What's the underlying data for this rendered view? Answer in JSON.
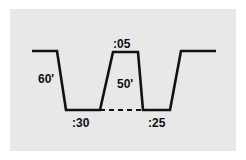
{
  "figure": {
    "background_color": "#ffffff",
    "panel_color": "#e8e8e8",
    "line_color": "#111111",
    "text_color": "#111111"
  },
  "labels": {
    "left_segment_elevation": "60'",
    "center_peak_time": ":05",
    "center_peak_elevation": "50'",
    "left_trough_time": ":30",
    "right_trough_time": ":25"
  },
  "chart_data": {
    "type": "line",
    "title": "",
    "xlabel": "",
    "ylabel": "",
    "grid": false,
    "legend": null,
    "xlim": [
      0,
      246
    ],
    "ylim": [
      160,
      0
    ],
    "series": [
      {
        "name": "profile",
        "style": "solid",
        "points": [
          [
            32,
            51
          ],
          [
            57,
            51
          ],
          [
            66,
            110
          ],
          [
            100,
            110
          ],
          [
            113,
            52
          ],
          [
            138,
            52
          ],
          [
            143,
            110
          ],
          [
            170,
            110
          ],
          [
            181,
            51
          ],
          [
            216,
            51
          ]
        ]
      },
      {
        "name": "trough-reference",
        "style": "dashed",
        "points": [
          [
            100,
            110
          ],
          [
            143,
            110
          ]
        ]
      }
    ],
    "annotations": [
      {
        "text": "60'",
        "x": 38,
        "y": 79,
        "anchor": "left"
      },
      {
        "text": ":05",
        "x": 113,
        "y": 44,
        "anchor": "left"
      },
      {
        "text": "50'",
        "x": 117,
        "y": 84,
        "anchor": "left"
      },
      {
        "text": ":30",
        "x": 72,
        "y": 123,
        "anchor": "left"
      },
      {
        "text": ":25",
        "x": 148,
        "y": 123,
        "anchor": "left"
      }
    ]
  }
}
